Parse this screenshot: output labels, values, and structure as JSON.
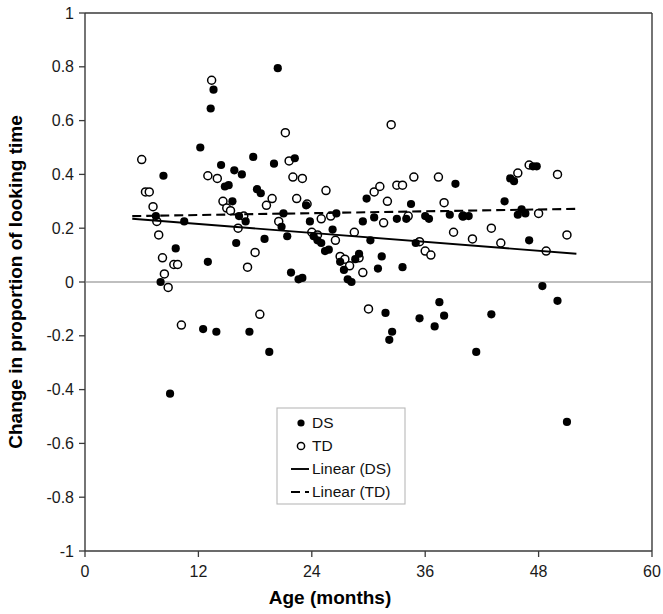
{
  "chart_data": {
    "type": "scatter",
    "title": "",
    "xlabel": "Age (months)",
    "ylabel": "Change in  proportion of looking time",
    "xlim": [
      0,
      60
    ],
    "ylim": [
      -1,
      1
    ],
    "xticks": [
      0,
      12,
      24,
      36,
      48,
      60
    ],
    "xtick_labels": [
      "0",
      "12",
      "24",
      "36",
      "48",
      "60"
    ],
    "yticks": [
      -1,
      -0.8,
      -0.6,
      -0.4,
      -0.2,
      0,
      0.2,
      0.4,
      0.6,
      0.8,
      1
    ],
    "ytick_labels": [
      "-1",
      "-0.8",
      "-0.6",
      "-0.4",
      "-0.2",
      "0",
      "0.2",
      "0.4",
      "0.6",
      "0.8",
      "1"
    ],
    "grid": false,
    "zero_line": true,
    "legend_position": "lower-center",
    "legend": [
      {
        "label": "DS",
        "marker": "filled-circle"
      },
      {
        "label": "TD",
        "marker": "open-circle"
      },
      {
        "label": "Linear (DS)",
        "marker": "solid-line"
      },
      {
        "label": "Linear (TD)",
        "marker": "dashed-line"
      }
    ],
    "series": [
      {
        "name": "DS",
        "marker": "filled-circle",
        "color": "#000000",
        "points": [
          [
            7.5,
            0.245
          ],
          [
            8.0,
            0.0
          ],
          [
            8.3,
            0.395
          ],
          [
            9.0,
            -0.415
          ],
          [
            9.6,
            0.125
          ],
          [
            10.5,
            0.225
          ],
          [
            12.2,
            0.5
          ],
          [
            12.5,
            -0.175
          ],
          [
            13.0,
            0.075
          ],
          [
            13.3,
            0.645
          ],
          [
            13.6,
            0.715
          ],
          [
            13.9,
            -0.185
          ],
          [
            14.4,
            0.435
          ],
          [
            14.8,
            0.355
          ],
          [
            15.2,
            0.36
          ],
          [
            15.6,
            0.3
          ],
          [
            15.8,
            0.415
          ],
          [
            16.0,
            0.145
          ],
          [
            16.3,
            0.245
          ],
          [
            16.6,
            0.4
          ],
          [
            17.0,
            0.225
          ],
          [
            17.4,
            -0.185
          ],
          [
            17.8,
            0.465
          ],
          [
            18.2,
            0.345
          ],
          [
            18.6,
            0.33
          ],
          [
            19.0,
            0.16
          ],
          [
            19.5,
            -0.26
          ],
          [
            20.0,
            0.44
          ],
          [
            20.4,
            0.795
          ],
          [
            20.8,
            0.205
          ],
          [
            21.0,
            0.255
          ],
          [
            21.4,
            0.17
          ],
          [
            21.8,
            0.035
          ],
          [
            22.2,
            0.46
          ],
          [
            22.6,
            0.01
          ],
          [
            23.0,
            0.015
          ],
          [
            23.4,
            0.285
          ],
          [
            23.8,
            0.225
          ],
          [
            24.2,
            0.17
          ],
          [
            24.6,
            0.155
          ],
          [
            25.0,
            0.145
          ],
          [
            25.4,
            0.115
          ],
          [
            25.8,
            0.12
          ],
          [
            26.2,
            0.195
          ],
          [
            26.6,
            0.255
          ],
          [
            27.0,
            0.075
          ],
          [
            27.4,
            0.045
          ],
          [
            27.8,
            0.01
          ],
          [
            28.2,
            0.0
          ],
          [
            28.6,
            0.085
          ],
          [
            29.0,
            0.105
          ],
          [
            29.4,
            0.225
          ],
          [
            29.8,
            0.31
          ],
          [
            30.2,
            0.155
          ],
          [
            30.6,
            0.24
          ],
          [
            31.0,
            0.05
          ],
          [
            31.4,
            0.095
          ],
          [
            31.8,
            -0.115
          ],
          [
            32.2,
            -0.215
          ],
          [
            32.5,
            -0.185
          ],
          [
            33.0,
            0.235
          ],
          [
            33.6,
            0.055
          ],
          [
            34.0,
            0.235
          ],
          [
            34.5,
            0.29
          ],
          [
            35.0,
            0.145
          ],
          [
            35.4,
            -0.135
          ],
          [
            36.0,
            0.245
          ],
          [
            36.4,
            0.235
          ],
          [
            37.0,
            -0.165
          ],
          [
            37.5,
            -0.075
          ],
          [
            38.0,
            -0.125
          ],
          [
            38.6,
            0.25
          ],
          [
            39.2,
            0.365
          ],
          [
            40.0,
            0.245
          ],
          [
            40.6,
            0.245
          ],
          [
            41.4,
            -0.26
          ],
          [
            43.0,
            -0.12
          ],
          [
            44.4,
            0.3
          ],
          [
            45.0,
            0.385
          ],
          [
            45.4,
            0.375
          ],
          [
            45.8,
            0.25
          ],
          [
            46.2,
            0.27
          ],
          [
            46.6,
            0.255
          ],
          [
            47.0,
            0.155
          ],
          [
            47.4,
            0.43
          ],
          [
            47.8,
            0.43
          ],
          [
            48.4,
            -0.015
          ],
          [
            50.0,
            -0.07
          ],
          [
            51.0,
            -0.52
          ]
        ]
      },
      {
        "name": "TD",
        "marker": "open-circle",
        "color": "#ffffff",
        "points": [
          [
            6.0,
            0.455
          ],
          [
            6.4,
            0.335
          ],
          [
            6.8,
            0.335
          ],
          [
            7.2,
            0.28
          ],
          [
            7.6,
            0.225
          ],
          [
            7.8,
            0.175
          ],
          [
            8.2,
            0.09
          ],
          [
            8.4,
            0.03
          ],
          [
            8.8,
            -0.02
          ],
          [
            9.4,
            0.065
          ],
          [
            9.8,
            0.065
          ],
          [
            10.2,
            -0.16
          ],
          [
            13.0,
            0.395
          ],
          [
            13.4,
            0.75
          ],
          [
            14.0,
            0.385
          ],
          [
            14.6,
            0.3
          ],
          [
            15.0,
            0.275
          ],
          [
            15.4,
            0.265
          ],
          [
            16.2,
            0.2
          ],
          [
            16.8,
            0.245
          ],
          [
            17.2,
            0.055
          ],
          [
            18.0,
            0.11
          ],
          [
            18.5,
            -0.12
          ],
          [
            19.2,
            0.285
          ],
          [
            19.8,
            0.31
          ],
          [
            20.5,
            0.225
          ],
          [
            21.2,
            0.555
          ],
          [
            21.6,
            0.45
          ],
          [
            22.0,
            0.39
          ],
          [
            22.4,
            0.31
          ],
          [
            23.0,
            0.385
          ],
          [
            23.5,
            0.29
          ],
          [
            24.0,
            0.185
          ],
          [
            24.6,
            0.175
          ],
          [
            25.0,
            0.235
          ],
          [
            25.5,
            0.34
          ],
          [
            26.0,
            0.245
          ],
          [
            26.5,
            0.155
          ],
          [
            27.0,
            0.095
          ],
          [
            27.5,
            0.085
          ],
          [
            28.0,
            0.06
          ],
          [
            28.5,
            0.185
          ],
          [
            29.0,
            0.09
          ],
          [
            29.4,
            0.035
          ],
          [
            30.0,
            -0.1
          ],
          [
            30.6,
            0.335
          ],
          [
            31.2,
            0.355
          ],
          [
            31.6,
            0.22
          ],
          [
            32.0,
            0.3
          ],
          [
            32.4,
            0.585
          ],
          [
            33.0,
            0.36
          ],
          [
            33.6,
            0.36
          ],
          [
            34.2,
            0.245
          ],
          [
            34.8,
            0.39
          ],
          [
            35.4,
            0.15
          ],
          [
            36.0,
            0.115
          ],
          [
            36.6,
            0.1
          ],
          [
            37.4,
            0.39
          ],
          [
            38.0,
            0.295
          ],
          [
            39.0,
            0.185
          ],
          [
            40.0,
            0.245
          ],
          [
            41.0,
            0.16
          ],
          [
            43.0,
            0.2
          ],
          [
            44.0,
            0.145
          ],
          [
            45.8,
            0.405
          ],
          [
            47.0,
            0.435
          ],
          [
            48.0,
            0.255
          ],
          [
            48.8,
            0.115
          ],
          [
            50.0,
            0.4
          ],
          [
            51.0,
            0.175
          ]
        ]
      }
    ],
    "trendlines": [
      {
        "name": "Linear (DS)",
        "style": "solid",
        "x_start": 5.0,
        "y_start": 0.235,
        "x_end": 52.0,
        "y_end": 0.105
      },
      {
        "name": "Linear (TD)",
        "style": "dashed",
        "x_start": 5.0,
        "y_start": 0.245,
        "x_end": 52.2,
        "y_end": 0.272
      }
    ]
  },
  "axes": {
    "x_title": "Age (months)",
    "y_title": "Change in  proportion of looking time"
  }
}
